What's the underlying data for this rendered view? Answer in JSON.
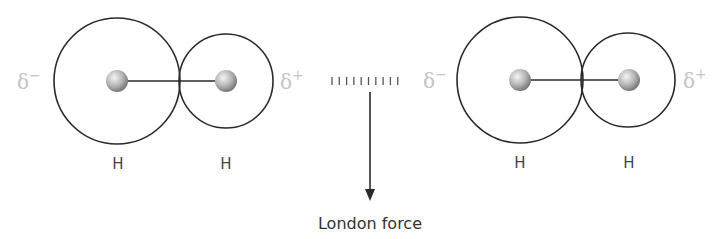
{
  "diagram": {
    "colors": {
      "outline": "#2a2a2a",
      "delta_text": "#c4c4c4",
      "label_text": "#444444",
      "caption_text": "#333333",
      "sphere_light": "#f2f2f2",
      "sphere_dark": "#7a7a7a"
    },
    "molecules": [
      {
        "name": "left-molecule",
        "partial_charge_left": "δ",
        "partial_charge_left_sign": "−",
        "partial_charge_right": "δ",
        "partial_charge_right_sign": "+",
        "atoms": [
          {
            "label": "H",
            "cloud": "large"
          },
          {
            "label": "H",
            "cloud": "small"
          }
        ]
      },
      {
        "name": "right-molecule",
        "partial_charge_left": "δ",
        "partial_charge_left_sign": "−",
        "partial_charge_right": "δ",
        "partial_charge_right_sign": "+",
        "atoms": [
          {
            "label": "H",
            "cloud": "large"
          },
          {
            "label": "H",
            "cloud": "small"
          }
        ]
      }
    ],
    "interaction": {
      "dash_count": 10,
      "caption": "London force",
      "icon": "arrow-down-icon"
    }
  }
}
